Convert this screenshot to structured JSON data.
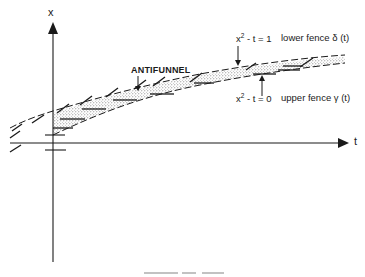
{
  "diagram": {
    "type": "antifunnel-diagram",
    "axes": {
      "vertical_label": "x",
      "horizontal_label": "t"
    },
    "region_label": "ANTIFUNNEL",
    "lower_fence": {
      "equation_base": "x",
      "equation_exp": "2",
      "equation_rest": " - t = 1",
      "description": "lower fence δ (t)"
    },
    "upper_fence": {
      "equation_base": "x",
      "equation_exp": "2",
      "equation_rest": " - t = 0",
      "description": "upper fence γ (t)"
    },
    "caption_visible": "partially cropped at bottom edge",
    "colors": {
      "ink": "#1a1a1a",
      "stipple": "#8a8a8a",
      "background": "#ffffff"
    }
  }
}
